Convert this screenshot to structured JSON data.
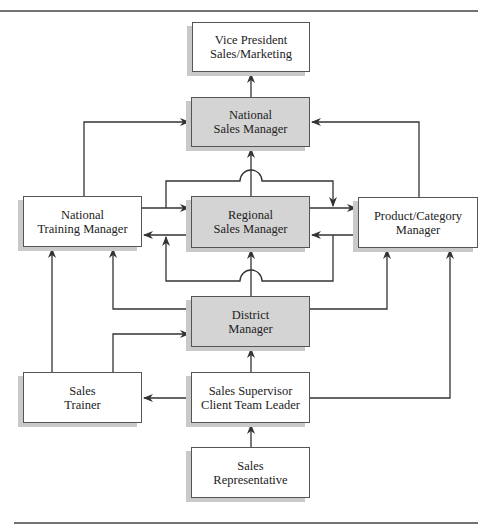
{
  "diagram": {
    "title": "",
    "nodes": {
      "vp": {
        "line1": "Vice President",
        "line2": "Sales/Marketing",
        "shaded": false
      },
      "nsm": {
        "line1": "National",
        "line2": "Sales Manager",
        "shaded": true
      },
      "ntm": {
        "line1": "National",
        "line2": "Training Manager",
        "shaded": false
      },
      "rsm": {
        "line1": "Regional",
        "line2": "Sales Manager",
        "shaded": true
      },
      "pcm": {
        "line1": "Product/Category",
        "line2": "Manager",
        "shaded": false
      },
      "dm": {
        "line1": "District",
        "line2": "Manager",
        "shaded": true
      },
      "trainer": {
        "line1": "Sales",
        "line2": "Trainer",
        "shaded": false
      },
      "supervisor": {
        "line1": "Sales Supervisor",
        "line2": "Client Team Leader",
        "shaded": false
      },
      "rep": {
        "line1": "Sales",
        "line2": "Representative",
        "shaded": false
      }
    },
    "edges": [
      {
        "from": "nsm",
        "to": "vp"
      },
      {
        "from": "ntm",
        "to": "nsm"
      },
      {
        "from": "pcm",
        "to": "nsm"
      },
      {
        "from": "rsm",
        "to": "nsm"
      },
      {
        "from": "ntm",
        "to": "rsm"
      },
      {
        "from": "rsm",
        "to": "ntm"
      },
      {
        "from": "rsm",
        "to": "pcm"
      },
      {
        "from": "pcm",
        "to": "rsm"
      },
      {
        "from": "ntm",
        "to": "pcm"
      },
      {
        "from": "pcm",
        "to": "ntm"
      },
      {
        "from": "dm",
        "to": "rsm"
      },
      {
        "from": "dm",
        "to": "ntm"
      },
      {
        "from": "dm",
        "to": "pcm"
      },
      {
        "from": "trainer",
        "to": "ntm"
      },
      {
        "from": "trainer",
        "to": "dm"
      },
      {
        "from": "supervisor",
        "to": "dm"
      },
      {
        "from": "supervisor",
        "to": "trainer"
      },
      {
        "from": "supervisor",
        "to": "pcm"
      },
      {
        "from": "rep",
        "to": "supervisor"
      }
    ],
    "colors": {
      "shaded_fill": "#d4d4d4",
      "line": "#333333",
      "shadow": "#c9c9c9"
    }
  }
}
